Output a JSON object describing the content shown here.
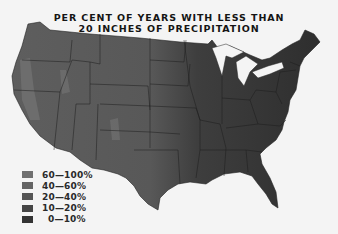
{
  "map": {
    "title_line1": "PER CENT OF YEARS WITH LESS THAN",
    "title_line2": "20 INCHES OF PRECIPITATION",
    "region": "Contiguous United States",
    "legend": [
      {
        "label": "60—100%",
        "color": "#707070"
      },
      {
        "label": "40—60%",
        "color": "#646464"
      },
      {
        "label": "20—40%",
        "color": "#555555"
      },
      {
        "label": "10—20%",
        "color": "#454545"
      },
      {
        "label": "0—10%",
        "color": "#333333"
      }
    ]
  }
}
